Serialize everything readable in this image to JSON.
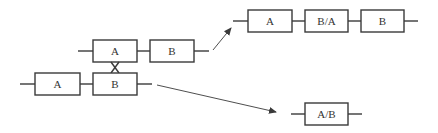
{
  "diagram": {
    "parent_top": {
      "genes": [
        "A",
        "B"
      ]
    },
    "parent_bottom": {
      "genes": [
        "A",
        "B"
      ]
    },
    "crossover_marker": "X",
    "result_top": {
      "genes": [
        "A",
        "B/A",
        "B"
      ]
    },
    "result_bottom": {
      "genes": [
        "A/B"
      ]
    },
    "colors": {
      "stroke": "#3a3a3a",
      "text": "#333333",
      "background": "#ffffff"
    }
  }
}
